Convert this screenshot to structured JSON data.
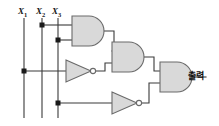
{
  "figure": {
    "background_color": "#ffffff",
    "wire_color": "#3a3a3a",
    "gate_stroke_color": "#555555",
    "gate_fill_color": "#d8d8d8",
    "junction_color": "#1a1a1a",
    "width": 219,
    "height": 126
  },
  "inputs": [
    {
      "name": "x1",
      "label": "X",
      "subscript": "1",
      "x": 24,
      "y_label": 13,
      "line_top": 18,
      "line_bottom": 118
    },
    {
      "name": "x2",
      "label": "X",
      "subscript": "2",
      "x": 42,
      "y_label": 13,
      "line_top": 18,
      "line_bottom": 118
    },
    {
      "name": "x3",
      "label": "X",
      "subscript": "3",
      "x": 58,
      "y_label": 13,
      "line_top": 18,
      "line_bottom": 118
    }
  ],
  "junctions": [
    {
      "name": "junction-x2-to-and1",
      "x": 42,
      "y": 25
    },
    {
      "name": "junction-x3-to-and1",
      "x": 58,
      "y": 40
    },
    {
      "name": "junction-x1-to-not1",
      "x": 24,
      "y": 71
    },
    {
      "name": "junction-x3-to-not2",
      "x": 58,
      "y": 103
    }
  ],
  "gates": [
    {
      "name": "and-gate-1",
      "type": "AND",
      "x": 72,
      "y": 16,
      "width": 32,
      "height": 30,
      "inputs": [
        "x2",
        "x3"
      ],
      "output_to": "and-gate-2"
    },
    {
      "name": "and-gate-2",
      "type": "AND",
      "x": 112,
      "y": 42,
      "width": 32,
      "height": 30,
      "inputs": [
        "and-gate-1",
        "not-gate-1"
      ],
      "output_to": "and-gate-3"
    },
    {
      "name": "and-gate-3",
      "type": "AND",
      "x": 160,
      "y": 62,
      "width": 32,
      "height": 30,
      "inputs": [
        "and-gate-2",
        "not-gate-2"
      ],
      "output_to": "output"
    },
    {
      "name": "not-gate-1",
      "type": "NOT",
      "x": 66,
      "y": 60,
      "width": 26,
      "height": 22,
      "inputs": [
        "x1"
      ],
      "output_to": "and-gate-2"
    },
    {
      "name": "not-gate-2",
      "type": "NOT",
      "x": 112,
      "y": 92,
      "width": 26,
      "height": 22,
      "inputs": [
        "x3"
      ],
      "output_to": "and-gate-3"
    }
  ],
  "output": {
    "name": "output-node",
    "label": "출력",
    "x": 196,
    "y": 73,
    "wire_from_x": 192,
    "wire_to_x": 212
  }
}
